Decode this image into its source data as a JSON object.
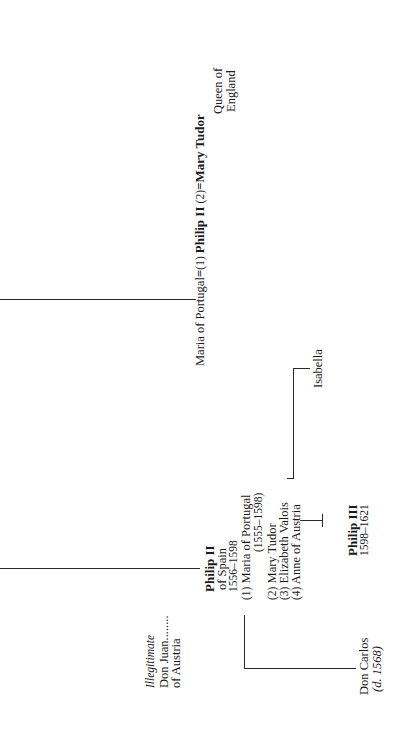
{
  "diagram": {
    "type": "genealogy-tree",
    "orientation": "rotated-90-ccw",
    "marriage_line": {
      "first_wife": "Maria of Portugal",
      "equals_1": "=",
      "marker_1": "(1)",
      "husband": "Philip II",
      "marker_2": "(2)",
      "equals_2": "=",
      "second_wife": "Mary Tudor",
      "second_wife_title_1": "Queen of",
      "second_wife_title_2": "England"
    },
    "illegitimate": {
      "label": "Illegitimate",
      "name": "Don Juan",
      "dots": "........",
      "of": "of Austria"
    },
    "philip_ii": {
      "name": "Philip II",
      "title": "of Spain",
      "reign": "1556–1598",
      "wives": [
        {
          "marker": "(1)",
          "name": "Maria of Portugal",
          "dates": "(1555–1598)"
        },
        {
          "marker": "(2)",
          "name": "Mary Tudor"
        },
        {
          "marker": "(3)",
          "name": "Elizabeth Valois"
        },
        {
          "marker": "(4)",
          "name": "Anne of Austria"
        }
      ]
    },
    "don_carlos": {
      "name": "Don Carlos",
      "death": "(d. 1568)"
    },
    "philip_iii": {
      "name": "Philip III",
      "reign": "1598–1621"
    },
    "isabella": {
      "name": "Isabella"
    }
  }
}
